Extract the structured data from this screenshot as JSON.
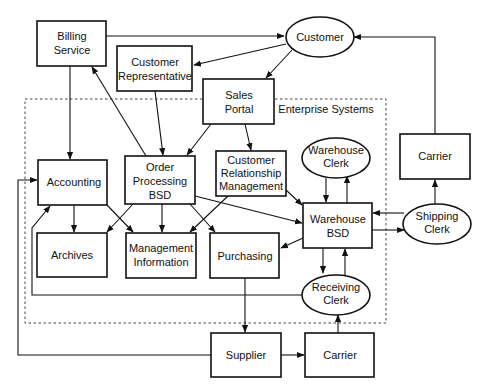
{
  "diagram": {
    "group_label": "Enterprise Systems",
    "nodes": {
      "billing": {
        "line1": "Billing",
        "line2": "Service",
        "shape": "rect"
      },
      "customer": {
        "line1": "Customer",
        "shape": "ellipse"
      },
      "cust_rep": {
        "line1": "Customer",
        "line2": "Representative",
        "shape": "rect"
      },
      "sales_portal": {
        "line1": "Sales",
        "line2": "Portal",
        "shape": "rect"
      },
      "accounting": {
        "line1": "Accounting",
        "shape": "rect"
      },
      "order_processing": {
        "line1": "Order",
        "line2": "Processing",
        "line3": "BSD",
        "shape": "rect"
      },
      "crm": {
        "line1": "Customer",
        "line2": "Relationship",
        "line3": "Management",
        "shape": "rect"
      },
      "warehouse_clerk": {
        "line1": "Warehouse",
        "line2": "Clerk",
        "shape": "ellipse"
      },
      "carrier_top": {
        "line1": "Carrier",
        "shape": "rect"
      },
      "warehouse_bsd": {
        "line1": "Warehouse",
        "line2": "BSD",
        "shape": "rect"
      },
      "shipping_clerk": {
        "line1": "Shipping",
        "line2": "Clerk",
        "shape": "ellipse"
      },
      "archives": {
        "line1": "Archives",
        "shape": "rect"
      },
      "mgmt_info": {
        "line1": "Management",
        "line2": "Information",
        "shape": "rect"
      },
      "purchasing": {
        "line1": "Purchasing",
        "shape": "rect"
      },
      "receiving_clerk": {
        "line1": "Receiving",
        "line2": "Clerk",
        "shape": "ellipse"
      },
      "supplier": {
        "line1": "Supplier",
        "shape": "rect"
      },
      "carrier_bottom": {
        "line1": "Carrier",
        "shape": "rect"
      }
    },
    "edges": [
      [
        "Billing Service",
        "Customer"
      ],
      [
        "Billing Service",
        "Accounting"
      ],
      [
        "Customer",
        "Customer Representative"
      ],
      [
        "Customer",
        "Sales Portal"
      ],
      [
        "Customer Representative",
        "Order Processing BSD"
      ],
      [
        "Sales Portal",
        "Order Processing BSD"
      ],
      [
        "Sales Portal",
        "Customer Relationship Management"
      ],
      [
        "Order Processing BSD",
        "Billing Service"
      ],
      [
        "Order Processing BSD",
        "Archives"
      ],
      [
        "Order Processing BSD",
        "Management Information"
      ],
      [
        "Order Processing BSD",
        "Purchasing"
      ],
      [
        "Order Processing BSD",
        "Warehouse BSD"
      ],
      [
        "Accounting",
        "Archives"
      ],
      [
        "Accounting",
        "Management Information"
      ],
      [
        "Customer Relationship Management",
        "Management Information"
      ],
      [
        "Customer Relationship Management",
        "Warehouse BSD"
      ],
      [
        "Warehouse Clerk",
        "Warehouse BSD"
      ],
      [
        "Warehouse BSD",
        "Warehouse Clerk"
      ],
      [
        "Warehouse BSD",
        "Purchasing"
      ],
      [
        "Warehouse BSD",
        "Shipping Clerk"
      ],
      [
        "Shipping Clerk",
        "Warehouse BSD"
      ],
      [
        "Shipping Clerk",
        "Carrier"
      ],
      [
        "Carrier",
        "Customer"
      ],
      [
        "Warehouse BSD",
        "Receiving Clerk"
      ],
      [
        "Receiving Clerk",
        "Warehouse BSD"
      ],
      [
        "Receiving Clerk",
        "Accounting"
      ],
      [
        "Purchasing",
        "Supplier"
      ],
      [
        "Supplier",
        "Carrier"
      ],
      [
        "Carrier",
        "Receiving Clerk"
      ],
      [
        "Supplier",
        "Accounting"
      ]
    ]
  }
}
